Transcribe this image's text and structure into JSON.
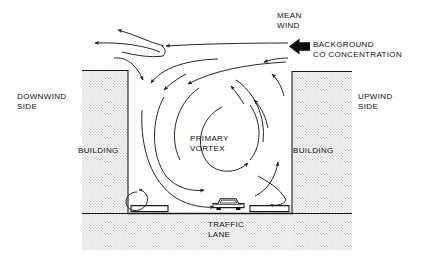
{
  "diagram": {
    "labels": {
      "mean_wind": "MEAN\nWIND",
      "background_co": "BACKGROUND\nCO CONCENTRATION",
      "downwind_side": "DOWNWIND\nSIDE",
      "upwind_side": "UPWIND\nSIDE",
      "building_left": "BUILDING",
      "building_right": "BUILDING",
      "primary_vortex": "PRIMARY\nVORTEX",
      "traffic_lane": "TRAFFIC\nLANE"
    },
    "colors": {
      "stroke": "#1a1a1a",
      "building_fill": "#e9e9e9",
      "ground_fill": "#ececec",
      "background": "#ffffff",
      "text": "#111111"
    },
    "icons": {
      "bold_wind_arrow": "bold-left-arrow-icon",
      "vehicle": "car-icon",
      "vortex": "spiral-vortex-icon",
      "corner_eddy": "circular-eddy-icon"
    },
    "geometry": {
      "left_building": {
        "x": 82,
        "y": 70,
        "width": 46,
        "height": 180
      },
      "right_building": {
        "x": 292,
        "y": 71,
        "width": 60,
        "height": 179
      },
      "street_floor_y": 213,
      "canyon_left_x": 128,
      "canyon_right_x": 292,
      "car_position": {
        "x": 228,
        "y": 206
      }
    },
    "flow_elements": [
      "mean-wind-streamline-upper",
      "mean-wind-streamline-mid",
      "mean-wind-streamline-lower",
      "background-co-inflow-arrow",
      "downwash-arrow-left-roof",
      "canyon-entrainment-arrow",
      "primary-vortex-outer-arc",
      "primary-vortex-mid-arc",
      "primary-vortex-inner-arc",
      "primary-vortex-core-arc",
      "upwind-wall-updraft-arrow",
      "street-level-sweep-arrow",
      "downwind-corner-eddy",
      "upwind-corner-eddy"
    ]
  }
}
